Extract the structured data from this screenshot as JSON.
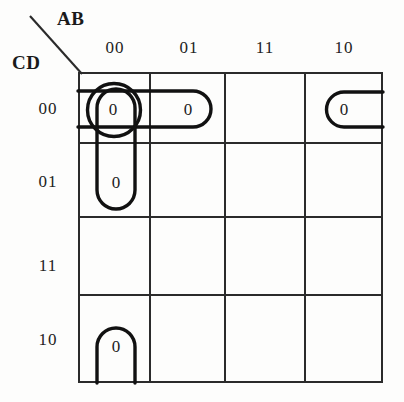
{
  "diagram": {
    "type": "karnaugh-map",
    "title_variables": {
      "columns_label": "AB",
      "rows_label": "CD"
    },
    "column_headers": [
      "00",
      "01",
      "11",
      "10"
    ],
    "row_headers": [
      "00",
      "01",
      "11",
      "10"
    ],
    "grid": {
      "rows": 4,
      "columns": 4,
      "line_color": "#2b2b2b",
      "background": "#fdfdfc"
    },
    "cells": [
      {
        "row": "00",
        "col": "00",
        "value": "0",
        "cx": 113,
        "cy": 110
      },
      {
        "row": "00",
        "col": "01",
        "value": "0",
        "cx": 188,
        "cy": 110
      },
      {
        "row": "00",
        "col": "11",
        "value": "",
        "cx": 265,
        "cy": 110
      },
      {
        "row": "00",
        "col": "10",
        "value": "0",
        "cx": 344,
        "cy": 110
      },
      {
        "row": "01",
        "col": "00",
        "value": "0",
        "cx": 116,
        "cy": 183
      },
      {
        "row": "01",
        "col": "01",
        "value": "",
        "cx": 188,
        "cy": 183
      },
      {
        "row": "01",
        "col": "11",
        "value": "",
        "cx": 265,
        "cy": 183
      },
      {
        "row": "01",
        "col": "10",
        "value": "",
        "cx": 344,
        "cy": 183
      },
      {
        "row": "11",
        "col": "00",
        "value": "",
        "cx": 113,
        "cy": 256
      },
      {
        "row": "11",
        "col": "01",
        "value": "",
        "cx": 188,
        "cy": 256
      },
      {
        "row": "11",
        "col": "11",
        "value": "",
        "cx": 265,
        "cy": 256
      },
      {
        "row": "11",
        "col": "10",
        "value": "",
        "cx": 344,
        "cy": 256
      },
      {
        "row": "10",
        "col": "00",
        "value": "0",
        "cx": 116,
        "cy": 347
      },
      {
        "row": "10",
        "col": "01",
        "value": "",
        "cx": 188,
        "cy": 347
      },
      {
        "row": "10",
        "col": "11",
        "value": "",
        "cx": 265,
        "cy": 347
      },
      {
        "row": "10",
        "col": "10",
        "value": "",
        "cx": 344,
        "cy": 347
      }
    ],
    "groups": [
      {
        "name": "horizontal-pair-row00-cols-00-01",
        "shape": "pill-open-left",
        "covers": [
          "00/00",
          "00/01"
        ],
        "stroke": "#111111"
      },
      {
        "name": "single-circle-row00-col00",
        "shape": "circle",
        "covers": [
          "00/00"
        ],
        "stroke": "#111111"
      },
      {
        "name": "vertical-pair-col00-rows-00-01",
        "shape": "pill-vertical",
        "covers": [
          "00/00",
          "01/00"
        ],
        "stroke": "#111111"
      },
      {
        "name": "wrap-pair-row00-col10",
        "shape": "pill-open-right",
        "covers": [
          "00/10"
        ],
        "stroke": "#111111"
      },
      {
        "name": "wrap-pair-row10-col00",
        "shape": "pill-open-bottom",
        "covers": [
          "10/00"
        ],
        "stroke": "#111111"
      }
    ]
  }
}
